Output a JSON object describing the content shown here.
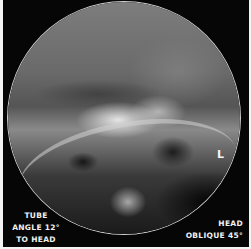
{
  "image": {
    "description": "Circular-field radiograph of the skull, oblique head view",
    "annotations": {
      "left_line1": "TUBE",
      "left_line2": "ANGLE 12°",
      "left_line3": "TO HEAD",
      "right_line1": "HEAD",
      "right_line2": "OBLIQUE 45°",
      "side_marker": "L"
    },
    "colors": {
      "background": "#060606",
      "text": "#f2f2f2",
      "border": "#f4f4f4"
    }
  }
}
